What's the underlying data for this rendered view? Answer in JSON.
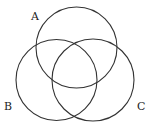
{
  "diagram": {
    "type": "venn",
    "sets": [
      {
        "label": "A",
        "cx": 76.5,
        "cy": 47.5,
        "r": 40.5,
        "label_x": 31,
        "label_y": 20
      },
      {
        "label": "B",
        "cx": 56.5,
        "cy": 80,
        "r": 40.5,
        "label_x": 4,
        "label_y": 110
      },
      {
        "label": "C",
        "cx": 93,
        "cy": 80,
        "r": 41,
        "label_x": 137,
        "label_y": 110
      }
    ],
    "stroke_color": "#333333",
    "background": "#ffffff"
  }
}
